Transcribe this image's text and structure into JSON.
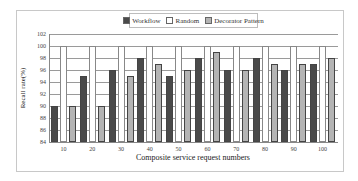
{
  "chart_data": {
    "type": "bar",
    "title": "",
    "xlabel": "Composite service request numbers",
    "ylabel": "Recall rate(%)",
    "ylim": [
      84,
      102
    ],
    "yticks": [
      84,
      86,
      88,
      90,
      92,
      94,
      96,
      98,
      100,
      102
    ],
    "grid": true,
    "legend_position": "top",
    "categories": [
      "10",
      "20",
      "30",
      "40",
      "50",
      "60",
      "70",
      "80",
      "90",
      "100"
    ],
    "series": [
      {
        "name": "Workflow",
        "color": "#4a4a4a",
        "values": [
          90,
          95,
          96,
          98,
          95,
          98,
          96,
          98,
          96,
          97
        ]
      },
      {
        "name": "Random",
        "color": "#ffffff",
        "values": [
          100,
          100,
          100,
          100,
          100,
          100,
          100,
          100,
          100,
          100
        ]
      },
      {
        "name": "Decorator Pattern",
        "color": "#b4b4b4",
        "values": [
          90,
          90,
          95,
          97,
          96,
          99,
          96,
          97,
          97,
          98
        ]
      }
    ]
  },
  "legend": {
    "items": [
      {
        "label": "Workflow",
        "color": "#4a4a4a"
      },
      {
        "label": "Random",
        "color": "#ffffff"
      },
      {
        "label": "Decorator Pattern",
        "color": "#b4b4b4"
      }
    ]
  }
}
